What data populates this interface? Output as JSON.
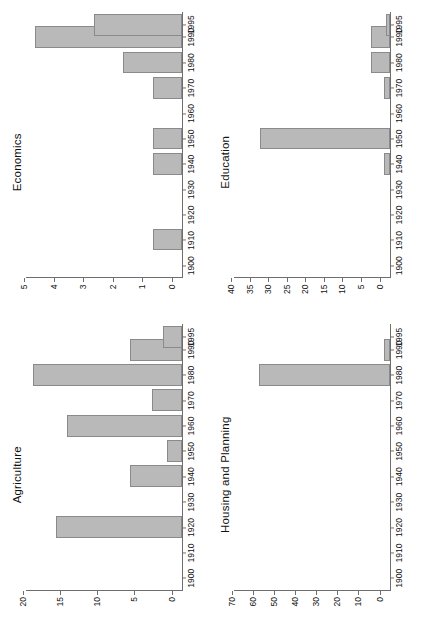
{
  "figure": {
    "orientation": "rotated-90-ccw",
    "bar_fill": "#b9b9b9",
    "bar_stroke": "#8a8a8a",
    "axis_color": "#6e6e6e",
    "background": "#ffffff"
  },
  "panels": [
    {
      "id": "agriculture",
      "title": "Agriculture",
      "chart_data": {
        "type": "bar",
        "title": "Agriculture",
        "orientation": "vertical",
        "xlabel": "",
        "ylabel": "",
        "grid": false,
        "legend": false,
        "xlim": [
          1895,
          2000
        ],
        "ylim": [
          0,
          21
        ],
        "yticks": [
          0,
          5,
          10,
          15,
          20
        ],
        "ytick_labels": [
          "0",
          "5",
          "10",
          "15",
          "20"
        ],
        "xticks": [
          1900,
          1910,
          1920,
          1930,
          1940,
          1950,
          1960,
          1970,
          1980,
          1990,
          1995
        ],
        "xtick_labels": [
          "1900",
          "1910",
          "1920",
          "1930",
          "1940",
          "1950",
          "1960",
          "1970",
          "1980",
          "1990",
          "1995"
        ],
        "x": [
          1920,
          1940,
          1950,
          1960,
          1970,
          1980,
          1990,
          1995
        ],
        "values": [
          17,
          7,
          2,
          15.5,
          4,
          20,
          7,
          2.5
        ]
      }
    },
    {
      "id": "economics",
      "title": "Economics",
      "chart_data": {
        "type": "bar",
        "title": "Economics",
        "orientation": "vertical",
        "xlabel": "",
        "ylabel": "",
        "grid": false,
        "legend": false,
        "xlim": [
          1895,
          2000
        ],
        "ylim": [
          0,
          5.3
        ],
        "yticks": [
          0,
          1,
          2,
          3,
          4,
          5
        ],
        "ytick_labels": [
          "0",
          "1",
          "2",
          "3",
          "4",
          "5"
        ],
        "xticks": [
          1900,
          1910,
          1920,
          1930,
          1940,
          1950,
          1960,
          1970,
          1980,
          1990,
          1995
        ],
        "xtick_labels": [
          "1900",
          "1910",
          "1920",
          "1930",
          "1940",
          "1950",
          "1960",
          "1970",
          "1980",
          "1990",
          "1995"
        ],
        "x": [
          1910,
          1940,
          1950,
          1970,
          1980,
          1990,
          1995
        ],
        "values": [
          1,
          1,
          1,
          1,
          2,
          5,
          3
        ]
      }
    },
    {
      "id": "housing-and-planning",
      "title": "Housing and Planning",
      "chart_data": {
        "type": "bar",
        "title": "Housing and Planning",
        "orientation": "vertical",
        "xlabel": "",
        "ylabel": "",
        "grid": false,
        "legend": false,
        "xlim": [
          1895,
          2000
        ],
        "ylim": [
          0,
          74
        ],
        "yticks": [
          0,
          10,
          20,
          30,
          40,
          50,
          60,
          70
        ],
        "ytick_labels": [
          "0",
          "10",
          "20",
          "30",
          "40",
          "50",
          "60",
          "70"
        ],
        "xticks": [
          1900,
          1910,
          1920,
          1930,
          1940,
          1950,
          1960,
          1970,
          1980,
          1990,
          1995
        ],
        "xtick_labels": [
          "1900",
          "1910",
          "1920",
          "1930",
          "1940",
          "1950",
          "1960",
          "1970",
          "1980",
          "1990",
          "1995"
        ],
        "x": [
          1980,
          1990
        ],
        "values": [
          62,
          3
        ]
      }
    },
    {
      "id": "education",
      "title": "Education",
      "chart_data": {
        "type": "bar",
        "title": "Education",
        "orientation": "vertical",
        "xlabel": "",
        "ylabel": "",
        "grid": false,
        "legend": false,
        "xlim": [
          1895,
          2000
        ],
        "ylim": [
          0,
          42
        ],
        "yticks": [
          0,
          5,
          10,
          15,
          20,
          25,
          30,
          35,
          40
        ],
        "ytick_labels": [
          "0",
          "5",
          "10",
          "15",
          "20",
          "25",
          "30",
          "35",
          "40"
        ],
        "xticks": [
          1900,
          1910,
          1920,
          1930,
          1940,
          1950,
          1960,
          1970,
          1980,
          1990,
          1995
        ],
        "xtick_labels": [
          "1900",
          "1910",
          "1920",
          "1930",
          "1940",
          "1950",
          "1960",
          "1970",
          "1980",
          "1990",
          "1995"
        ],
        "x": [
          1940,
          1950,
          1970,
          1980,
          1990,
          1995
        ],
        "values": [
          1.5,
          35,
          1.5,
          5,
          5,
          1
        ]
      }
    }
  ]
}
